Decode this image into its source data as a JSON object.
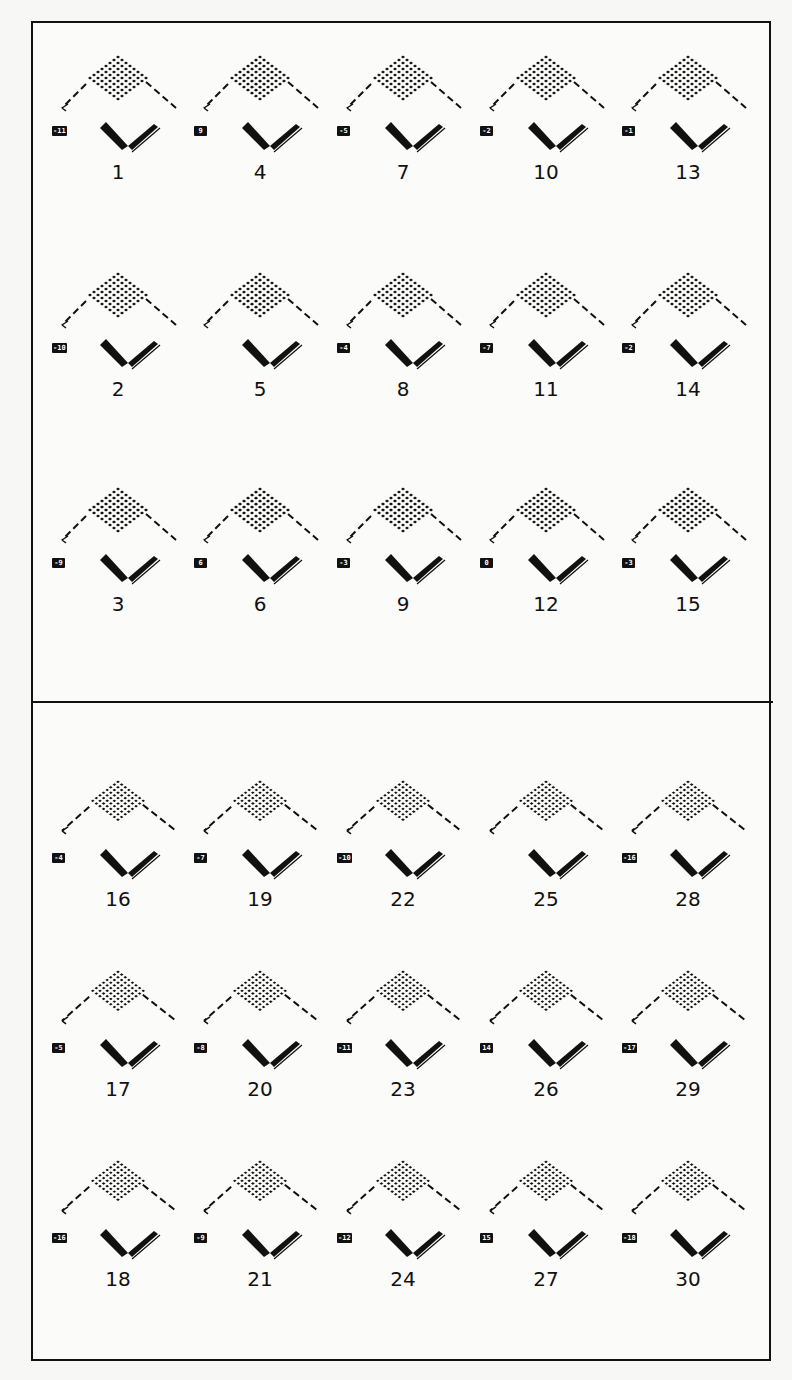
{
  "figure": {
    "border_color": "#111111",
    "background": "#fbfbf9",
    "sections": 2
  },
  "panels": [
    {
      "id": "1",
      "tag": "-11",
      "col": 0,
      "row": 0
    },
    {
      "id": "4",
      "tag": "9",
      "col": 1,
      "row": 0
    },
    {
      "id": "7",
      "tag": "-5",
      "col": 2,
      "row": 0
    },
    {
      "id": "10",
      "tag": "-2",
      "col": 3,
      "row": 0
    },
    {
      "id": "13",
      "tag": "-1",
      "col": 4,
      "row": 0
    },
    {
      "id": "2",
      "tag": "-10",
      "col": 0,
      "row": 1
    },
    {
      "id": "5",
      "tag": "",
      "col": 1,
      "row": 1
    },
    {
      "id": "8",
      "tag": "-4",
      "col": 2,
      "row": 1
    },
    {
      "id": "11",
      "tag": "-7",
      "col": 3,
      "row": 1
    },
    {
      "id": "14",
      "tag": "-2",
      "col": 4,
      "row": 1
    },
    {
      "id": "3",
      "tag": "-9",
      "col": 0,
      "row": 2
    },
    {
      "id": "6",
      "tag": "6",
      "col": 1,
      "row": 2
    },
    {
      "id": "9",
      "tag": "-3",
      "col": 2,
      "row": 2
    },
    {
      "id": "12",
      "tag": "0",
      "col": 3,
      "row": 2
    },
    {
      "id": "15",
      "tag": "-3",
      "col": 4,
      "row": 2
    },
    {
      "id": "16",
      "tag": "-4",
      "col": 0,
      "row": 3
    },
    {
      "id": "19",
      "tag": "-7",
      "col": 1,
      "row": 3
    },
    {
      "id": "22",
      "tag": "-10",
      "col": 2,
      "row": 3
    },
    {
      "id": "25",
      "tag": "",
      "col": 3,
      "row": 3
    },
    {
      "id": "28",
      "tag": "-16",
      "col": 4,
      "row": 3
    },
    {
      "id": "17",
      "tag": "-5",
      "col": 0,
      "row": 4
    },
    {
      "id": "20",
      "tag": "-8",
      "col": 1,
      "row": 4
    },
    {
      "id": "23",
      "tag": "-11",
      "col": 2,
      "row": 4
    },
    {
      "id": "26",
      "tag": "14",
      "col": 3,
      "row": 4
    },
    {
      "id": "29",
      "tag": "-17",
      "col": 4,
      "row": 4
    },
    {
      "id": "18",
      "tag": "-16",
      "col": 0,
      "row": 5
    },
    {
      "id": "21",
      "tag": "-9",
      "col": 1,
      "row": 5
    },
    {
      "id": "24",
      "tag": "-12",
      "col": 2,
      "row": 5
    },
    {
      "id": "27",
      "tag": "15",
      "col": 3,
      "row": 5
    },
    {
      "id": "30",
      "tag": "-18",
      "col": 4,
      "row": 5
    }
  ]
}
